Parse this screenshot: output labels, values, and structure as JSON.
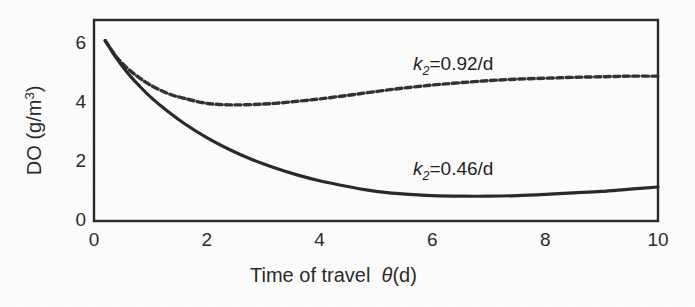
{
  "figure": {
    "background_color": "#fdfdfd",
    "ink_color": "#2b2b2b"
  },
  "axis": {
    "x_title_main": "Time of travel",
    "x_title_symbol": "θ",
    "x_title_unit": "(d)",
    "y_title_main": "DO (g/m",
    "y_title_exp": "3",
    "y_title_close": ")"
  },
  "labels": {
    "k2_high_symbol": "k",
    "k2_high_sub": "2",
    "k2_high_value": "=0.92/d",
    "k2_low_symbol": "k",
    "k2_low_sub": "2",
    "k2_low_value": "=0.46/d"
  },
  "chart_data": {
    "type": "line",
    "title": "",
    "xlabel": "Time of travel θ (d)",
    "ylabel": "DO (g/m3)",
    "xlim": [
      0,
      10
    ],
    "ylim": [
      0,
      6.8
    ],
    "xticks": [
      0,
      1,
      2,
      3,
      4,
      5,
      6,
      7,
      8,
      9,
      10
    ],
    "xtick_labels": [
      "0",
      "",
      "2",
      "",
      "4",
      "",
      "6",
      "",
      "8",
      "",
      "10"
    ],
    "yticks": [
      0,
      1,
      2,
      3,
      4,
      5,
      6
    ],
    "ytick_labels": [
      "0",
      "",
      "2",
      "",
      "4",
      "",
      "6"
    ],
    "grid": false,
    "legend": "inline-annotation",
    "series": [
      {
        "name": "k2=0.92/d",
        "style": "dashed",
        "color": "#333333",
        "annotation": "k2=0.92/d",
        "annotation_x": 5.9,
        "annotation_y": 5.85,
        "x": [
          0.2,
          0.4,
          0.6,
          0.8,
          1.0,
          1.3,
          1.6,
          2.0,
          2.4,
          2.8,
          3.2,
          3.6,
          4.0,
          4.5,
          5.0,
          5.5,
          6.0,
          6.5,
          7.0,
          7.5,
          8.0,
          8.5,
          9.0,
          9.5,
          10.0
        ],
        "y": [
          6.1,
          5.55,
          5.15,
          4.85,
          4.6,
          4.32,
          4.15,
          3.98,
          3.93,
          3.94,
          3.98,
          4.05,
          4.13,
          4.25,
          4.38,
          4.5,
          4.6,
          4.68,
          4.75,
          4.8,
          4.83,
          4.86,
          4.88,
          4.9,
          4.9
        ]
      },
      {
        "name": "k2=0.46/d",
        "style": "solid",
        "color": "#2b2b2b",
        "annotation": "k2=0.46/d",
        "annotation_x": 5.9,
        "annotation_y": 2.2,
        "x": [
          0.2,
          0.4,
          0.6,
          0.8,
          1.0,
          1.3,
          1.6,
          2.0,
          2.4,
          2.8,
          3.2,
          3.6,
          4.0,
          4.4,
          4.8,
          5.2,
          5.6,
          6.0,
          6.5,
          7.0,
          7.5,
          8.0,
          8.5,
          9.0,
          9.5,
          10.0
        ],
        "y": [
          6.1,
          5.5,
          5.0,
          4.58,
          4.2,
          3.72,
          3.3,
          2.82,
          2.42,
          2.08,
          1.8,
          1.56,
          1.36,
          1.2,
          1.06,
          0.96,
          0.9,
          0.86,
          0.84,
          0.84,
          0.86,
          0.9,
          0.95,
          1.0,
          1.08,
          1.15
        ]
      }
    ]
  }
}
